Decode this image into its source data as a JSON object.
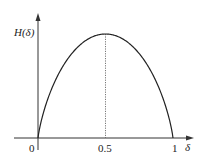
{
  "chart_data": {
    "type": "line",
    "title": "",
    "xlabel": "δ",
    "ylabel": "H(δ)",
    "x_ticks": [
      "0",
      "0.5",
      "1"
    ],
    "xlim": [
      0,
      1
    ],
    "ylim": [
      0,
      1
    ],
    "grid": false,
    "legend": null,
    "series": [
      {
        "name": "H(δ)",
        "x": [
          0,
          0.05,
          0.1,
          0.2,
          0.3,
          0.4,
          0.5,
          0.6,
          0.7,
          0.8,
          0.9,
          0.95,
          1
        ],
        "values": [
          0,
          0.286,
          0.469,
          0.722,
          0.881,
          0.971,
          1.0,
          0.971,
          0.881,
          0.722,
          0.469,
          0.286,
          0
        ]
      }
    ],
    "annotations": [
      {
        "type": "dotted-vertical-line",
        "x": 0.5,
        "from": 0,
        "to": 1.0
      }
    ]
  },
  "labels": {
    "y_axis": "H(δ)",
    "x_axis": "δ",
    "tick_0": "0",
    "tick_half": "0.5",
    "tick_1": "1"
  },
  "colors": {
    "axis": "#333333",
    "curve": "#222222",
    "dotted": "#555555"
  }
}
